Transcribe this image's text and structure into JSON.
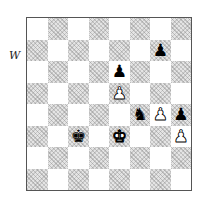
{
  "side_to_move_label": "W",
  "board": {
    "orientation": "white-bottom",
    "files": [
      "a",
      "b",
      "c",
      "d",
      "e",
      "f",
      "g",
      "h"
    ],
    "ranks": [
      8,
      7,
      6,
      5,
      4,
      3,
      2,
      1
    ],
    "colors": {
      "light": "#ffffff",
      "dark": "#e4e4e4"
    },
    "pieces": [
      {
        "square": "g7",
        "color": "black",
        "type": "pawn",
        "glyph": "♟"
      },
      {
        "square": "e6",
        "color": "black",
        "type": "pawn",
        "glyph": "♟"
      },
      {
        "square": "e5",
        "color": "white",
        "type": "pawn",
        "glyph": "♟"
      },
      {
        "square": "f4",
        "color": "black",
        "type": "knight",
        "glyph": "♞"
      },
      {
        "square": "g4",
        "color": "white",
        "type": "pawn",
        "glyph": "♟"
      },
      {
        "square": "h4",
        "color": "black",
        "type": "pawn",
        "glyph": "♟"
      },
      {
        "square": "c3",
        "color": "black",
        "type": "king",
        "glyph": "♚"
      },
      {
        "square": "e3",
        "color": "white",
        "type": "king",
        "glyph": "♚"
      },
      {
        "square": "h3",
        "color": "white",
        "type": "pawn",
        "glyph": "♟"
      }
    ],
    "fen": "8/6p1/4p3/4P3/5nPp/2k1K2P/8/8 w - - 0 1"
  }
}
